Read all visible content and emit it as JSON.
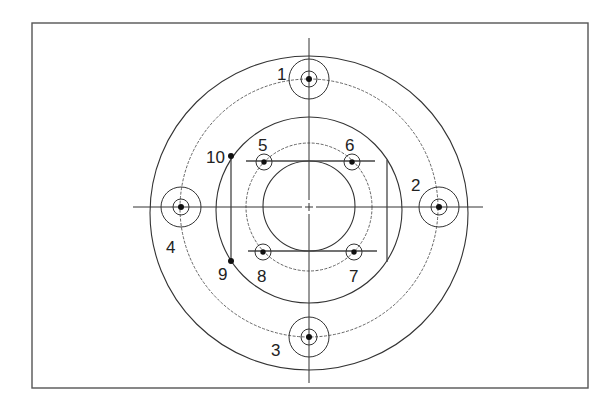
{
  "diagram": {
    "type": "flange-bolt-pattern-drawing",
    "colors": {
      "line": "#333333",
      "frame": "#555555",
      "background": "#ffffff"
    },
    "center": {
      "x": 309,
      "y": 207
    },
    "labels": {
      "bolt_1": "1",
      "bolt_2": "2",
      "bolt_3": "3",
      "bolt_4": "4",
      "hole_5": "5",
      "hole_6": "6",
      "hole_7": "7",
      "hole_8": "8",
      "point_9": "9",
      "point_10": "10"
    },
    "outer_bolts": [
      {
        "id": "1",
        "x": 309,
        "y": 79
      },
      {
        "id": "2",
        "x": 439,
        "y": 207
      },
      {
        "id": "3",
        "x": 309,
        "y": 337
      },
      {
        "id": "4",
        "x": 181,
        "y": 207
      }
    ],
    "inner_holes": [
      {
        "id": "5",
        "x": 264,
        "y": 162
      },
      {
        "id": "6",
        "x": 352,
        "y": 162
      },
      {
        "id": "7",
        "x": 354,
        "y": 252
      },
      {
        "id": "8",
        "x": 263,
        "y": 252
      }
    ],
    "points": [
      {
        "id": "9",
        "x": 231,
        "y": 261
      },
      {
        "id": "10",
        "x": 231,
        "y": 156
      }
    ]
  }
}
